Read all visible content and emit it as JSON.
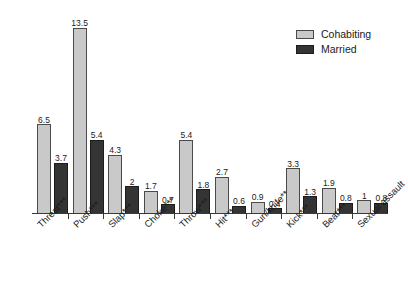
{
  "chart_data": {
    "type": "bar",
    "title": "",
    "xlabel": "",
    "ylabel": "",
    "ylim": [
      0,
      14.5
    ],
    "grid": false,
    "legend_position": "top-right",
    "categories": [
      "Threat***",
      "Push***",
      "Slap***",
      "Choke***",
      "Throw***",
      "Hit***",
      "Gun/knife**",
      "Kick***",
      "Beat***",
      "Sexual assault"
    ],
    "series": [
      {
        "name": "Cohabiting",
        "color": "#c9c9c9",
        "values": [
          6.5,
          13.5,
          4.3,
          1.7,
          5.4,
          2.7,
          0.9,
          3.3,
          1.9,
          1
        ]
      },
      {
        "name": "Married",
        "color": "#343434",
        "values": [
          3.7,
          5.4,
          2,
          0.7,
          1.8,
          0.6,
          0.4,
          1.3,
          0.8,
          0.8
        ]
      }
    ],
    "value_labels": {
      "Cohabiting": [
        "6.5",
        "13.5",
        "4.3",
        "1.7",
        "5.4",
        "2.7",
        "0.9",
        "3.3",
        "1.9",
        "1"
      ],
      "Married": [
        "3.7",
        "5.4",
        "2",
        "0.7",
        "1.8",
        "0.6",
        "0.4",
        "1.3",
        "0.8",
        "0.8"
      ]
    }
  },
  "legend": {
    "items": [
      {
        "label": "Cohabiting",
        "swatch": "cohab"
      },
      {
        "label": "Married",
        "swatch": "married"
      }
    ]
  }
}
